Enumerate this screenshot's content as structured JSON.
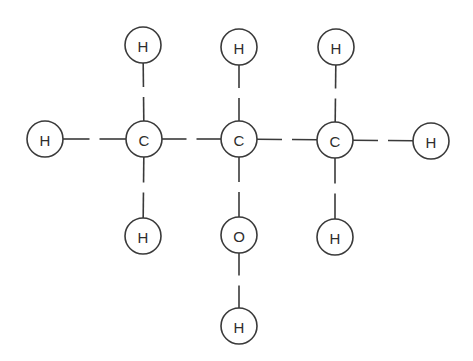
{
  "diagram": {
    "type": "molecular-structure",
    "style": {
      "background": "#ffffff",
      "stroke": "#3a3a3a",
      "label_color": "#2e2e2e",
      "atom_radius": 18,
      "bond_gap": 10
    },
    "atoms": [
      {
        "id": "C1",
        "element": "C",
        "label": "C",
        "x": 144,
        "y": 139
      },
      {
        "id": "C2",
        "element": "C",
        "label": "C",
        "x": 239,
        "y": 139
      },
      {
        "id": "C3",
        "element": "C",
        "label": "C",
        "x": 335,
        "y": 140
      },
      {
        "id": "O1",
        "element": "O",
        "label": "O",
        "x": 239,
        "y": 235
      },
      {
        "id": "H1",
        "element": "H",
        "label": "H",
        "x": 45,
        "y": 139
      },
      {
        "id": "H2",
        "element": "H",
        "label": "H",
        "x": 143,
        "y": 45
      },
      {
        "id": "H3",
        "element": "H",
        "label": "H",
        "x": 143,
        "y": 236
      },
      {
        "id": "H4",
        "element": "H",
        "label": "H",
        "x": 239,
        "y": 47
      },
      {
        "id": "H5",
        "element": "H",
        "label": "H",
        "x": 336,
        "y": 47
      },
      {
        "id": "H6",
        "element": "H",
        "label": "H",
        "x": 431,
        "y": 141
      },
      {
        "id": "H7",
        "element": "H",
        "label": "H",
        "x": 335,
        "y": 237
      },
      {
        "id": "H8",
        "element": "H",
        "label": "H",
        "x": 239,
        "y": 326
      }
    ],
    "bonds": [
      {
        "from": "H1",
        "to": "C1"
      },
      {
        "from": "C1",
        "to": "C2"
      },
      {
        "from": "C2",
        "to": "C3"
      },
      {
        "from": "C3",
        "to": "H6"
      },
      {
        "from": "H2",
        "to": "C1"
      },
      {
        "from": "C1",
        "to": "H3"
      },
      {
        "from": "H4",
        "to": "C2"
      },
      {
        "from": "C2",
        "to": "O1"
      },
      {
        "from": "O1",
        "to": "H8"
      },
      {
        "from": "H5",
        "to": "C3"
      },
      {
        "from": "C3",
        "to": "H7"
      }
    ]
  }
}
